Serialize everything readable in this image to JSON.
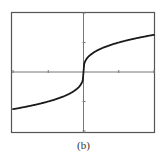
{
  "chart_data": {
    "type": "line",
    "title": "",
    "xlabel": "",
    "ylabel": "",
    "function": "y = cbrt(x)",
    "xlim": [
      -2,
      2
    ],
    "ylim": [
      -2,
      2
    ],
    "x_ticks": [
      -2,
      -1,
      0,
      1,
      2
    ],
    "y_ticks": [
      -2,
      -1,
      0,
      1,
      2
    ],
    "grid": false,
    "series": [
      {
        "name": "curve",
        "x": [
          -2,
          -1.5,
          -1,
          -0.5,
          -0.25,
          -0.1,
          -0.02,
          0,
          0.02,
          0.1,
          0.25,
          0.5,
          1,
          1.5,
          2
        ],
        "y": [
          -1.26,
          -1.145,
          -1.0,
          -0.794,
          -0.63,
          -0.464,
          -0.271,
          0,
          0.271,
          0.464,
          0.63,
          0.794,
          1.0,
          1.145,
          1.26
        ]
      }
    ]
  },
  "caption": "(b)",
  "colors": {
    "frame": "#555555",
    "axis": "#777777",
    "curve": "#1a1a1a"
  }
}
